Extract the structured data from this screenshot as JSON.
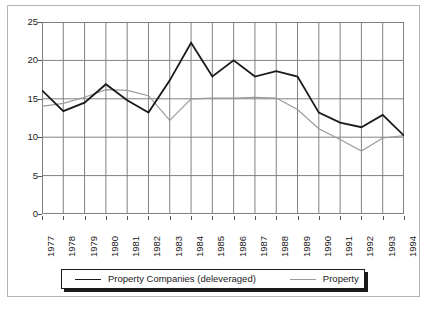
{
  "chart_data": {
    "type": "line",
    "title": "",
    "subtitle": "",
    "xlabel": "",
    "ylabel": "",
    "categories": [
      "1977",
      "1978",
      "1979",
      "1980",
      "1981",
      "1982",
      "1983",
      "1984",
      "1985",
      "1986",
      "1987",
      "1988",
      "1989",
      "1990",
      "1991",
      "1992",
      "1993",
      "1994"
    ],
    "x": [
      1977,
      1978,
      1979,
      1980,
      1981,
      1982,
      1983,
      1984,
      1985,
      1986,
      1987,
      1988,
      1989,
      1990,
      1991,
      1992,
      1993,
      1994
    ],
    "ylim": [
      0,
      25
    ],
    "yticks": [
      0,
      5,
      10,
      15,
      20,
      25
    ],
    "ytick_labels": [
      "0",
      "5",
      "10",
      "15",
      "20",
      "25"
    ],
    "grid": "both",
    "legend_position": "bottom",
    "series": [
      {
        "name": "Property Companies (deleveraged)",
        "color": "#1a1a1a",
        "width": 1.8,
        "values": [
          16.1,
          13.4,
          14.5,
          16.9,
          14.8,
          13.2,
          17.4,
          22.3,
          17.9,
          20.0,
          17.9,
          18.6,
          17.9,
          13.2,
          11.9,
          11.3,
          12.9,
          10.2
        ]
      },
      {
        "name": "Property",
        "color": "#9a9a9a",
        "width": 1.2,
        "values": [
          14.0,
          14.4,
          15.2,
          16.2,
          16.1,
          15.4,
          12.2,
          15.0,
          15.1,
          15.1,
          15.2,
          15.1,
          13.6,
          11.1,
          9.7,
          8.2,
          9.9,
          10.2
        ]
      }
    ]
  },
  "legend": {
    "items": [
      {
        "label": "Property Companies (deleveraged)",
        "color": "#1a1a1a"
      },
      {
        "label": "Property",
        "color": "#9a9a9a"
      }
    ]
  },
  "colors": {
    "frame": "#b4b4b4",
    "grid": "#808080",
    "axis": "#555555",
    "background": "#ffffff",
    "text": "#1a1a1a"
  }
}
